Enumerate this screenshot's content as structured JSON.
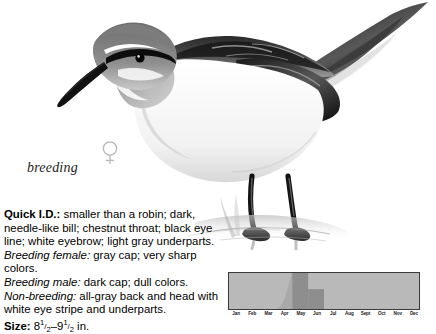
{
  "illustration": {
    "subject": "phalarope-breeding-female",
    "caption": "breeding",
    "sex_symbol": "female-venus-symbol",
    "sex_symbol_glyph": "♀"
  },
  "description": {
    "quick_id_label": "Quick I.D.:",
    "quick_id_text": " smaller than a robin; dark, needle-like bill; chestnut throat; black eye line; white eyebrow; light gray underparts.",
    "breeding_female_label": "Breeding female:",
    "breeding_female_text": " gray cap; very sharp colors.",
    "breeding_male_label": "Breeding male:",
    "breeding_male_text": " dark cap; dull colors.",
    "non_breeding_label": "Non-breeding:",
    "non_breeding_text": " all-gray back and head with white eye stripe and underparts.",
    "size_label": "Size:",
    "size_value_min_whole": "8",
    "size_value_min_num": "1",
    "size_value_min_den": "2",
    "size_dash": "–",
    "size_value_max_whole": "9",
    "size_value_max_num": "1",
    "size_value_max_den": "2",
    "size_unit": " in."
  },
  "chart_data": {
    "type": "bar",
    "title": "",
    "xlabel": "",
    "ylabel": "",
    "categories": [
      "Jan",
      "Feb",
      "Mar",
      "Apr",
      "May",
      "Jun",
      "Jul",
      "Aug",
      "Sept",
      "Oct",
      "Nov",
      "Dec"
    ],
    "values": [
      0,
      0,
      0,
      0,
      100,
      55,
      0,
      0,
      0,
      0,
      0,
      0
    ],
    "ylim": [
      0,
      100
    ],
    "grid": false,
    "legend": null,
    "colors": {
      "background": "#b9b9b9",
      "bar": "#8e8e8e",
      "border": "#3a3a3a",
      "label": "#1a1a1a"
    }
  }
}
